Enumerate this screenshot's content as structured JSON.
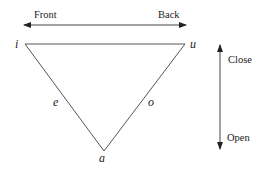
{
  "diagram": {
    "type": "vowel-triangle",
    "horizontal_axis": {
      "left_label": "Front",
      "right_label": "Back"
    },
    "vertical_axis": {
      "top_label": "Close",
      "bottom_label": "Open"
    },
    "vertices": {
      "top_left": "i",
      "top_right": "u",
      "bottom": "a"
    },
    "edge_labels": {
      "left_edge": "e",
      "right_edge": "o"
    },
    "colors": {
      "line": "#444444",
      "text": "#222222"
    }
  }
}
